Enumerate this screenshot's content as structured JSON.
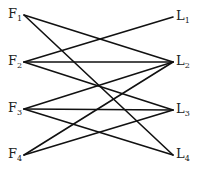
{
  "diagram": {
    "type": "bipartite-graph",
    "left_nodes": [
      {
        "id": "F1",
        "letter": "F",
        "sub": "1",
        "x": 24,
        "y": 15
      },
      {
        "id": "F2",
        "letter": "F",
        "sub": "2",
        "x": 24,
        "y": 62
      },
      {
        "id": "F3",
        "letter": "F",
        "sub": "3",
        "x": 24,
        "y": 109
      },
      {
        "id": "F4",
        "letter": "F",
        "sub": "4",
        "x": 24,
        "y": 155
      }
    ],
    "right_nodes": [
      {
        "id": "L1",
        "letter": "L",
        "sub": "1",
        "x": 173,
        "y": 17
      },
      {
        "id": "L2",
        "letter": "L",
        "sub": "2",
        "x": 173,
        "y": 62
      },
      {
        "id": "L3",
        "letter": "L",
        "sub": "3",
        "x": 173,
        "y": 110
      },
      {
        "id": "L4",
        "letter": "L",
        "sub": "4",
        "x": 173,
        "y": 155
      }
    ],
    "edges": [
      [
        "F1",
        "L2"
      ],
      [
        "F1",
        "L4"
      ],
      [
        "F2",
        "L1"
      ],
      [
        "F2",
        "L2"
      ],
      [
        "F2",
        "L3"
      ],
      [
        "F3",
        "L2"
      ],
      [
        "F3",
        "L3"
      ],
      [
        "F3",
        "L4"
      ],
      [
        "F4",
        "L2"
      ],
      [
        "F4",
        "L3"
      ]
    ],
    "line_color": "#111111"
  }
}
